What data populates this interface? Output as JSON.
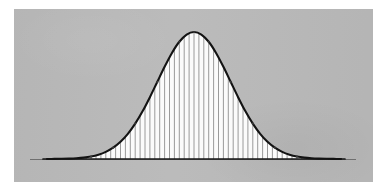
{
  "figure": {
    "kind": "scanned-statistics-figure",
    "caption_text": "",
    "panel": {
      "x": 14,
      "y": 9,
      "width": 359,
      "height": 173,
      "background_color": "#b9b9b9",
      "page_color": "#ffffff"
    }
  },
  "colors": {
    "page": "#ffffff",
    "panel_gray": "#b9b9b9",
    "curve_stroke": "#131313",
    "area_fill": "#fbfbfb",
    "tick_line": "#8e8e8e",
    "axis_line": "#6f6f6f",
    "baseline_dark": "#171717"
  },
  "chart_data": {
    "type": "area",
    "title": "",
    "subtitle": "",
    "xlabel": "",
    "ylabel": "",
    "legend": [],
    "legend_position": "none",
    "grid": false,
    "annotations": [],
    "distribution": "normal",
    "mean": 0,
    "std_dev": 1,
    "peak_density": 0.3989,
    "xlim": [
      -4,
      4
    ],
    "ylim": [
      0,
      0.42
    ],
    "tick_labels_x": [],
    "tick_labels_y": [],
    "fill_style": "vertical-riemann-lines",
    "num_fill_lines": 61,
    "x": [
      -4,
      -3.8,
      -3.6,
      -3.4,
      -3.2,
      -3,
      -2.8,
      -2.6,
      -2.4,
      -2.2,
      -2,
      -1.8,
      -1.6,
      -1.4,
      -1.2,
      -1,
      -0.8,
      -0.6,
      -0.4,
      -0.2,
      0,
      0.2,
      0.4,
      0.6,
      0.8,
      1,
      1.2,
      1.4,
      1.6,
      1.8,
      2,
      2.2,
      2.4,
      2.6,
      2.8,
      3,
      3.2,
      3.4,
      3.6,
      3.8,
      4
    ],
    "values": [
      0.0001,
      0.0003,
      0.0006,
      0.0012,
      0.0024,
      0.0044,
      0.0079,
      0.0136,
      0.0224,
      0.0355,
      0.054,
      0.079,
      0.1109,
      0.1497,
      0.1942,
      0.242,
      0.2897,
      0.3332,
      0.3683,
      0.391,
      0.3989,
      0.391,
      0.3683,
      0.3332,
      0.2897,
      0.242,
      0.1942,
      0.1497,
      0.1109,
      0.079,
      0.054,
      0.0355,
      0.0224,
      0.0136,
      0.0079,
      0.0044,
      0.0024,
      0.0012,
      0.0006,
      0.0003,
      0.0001
    ]
  },
  "geometry": {
    "baseline_y": 159,
    "peak_y": 32,
    "peak_x": 193,
    "curve_left_x": 47,
    "curve_right_x": 341,
    "axis_left_x": 30,
    "axis_right_x": 356
  }
}
